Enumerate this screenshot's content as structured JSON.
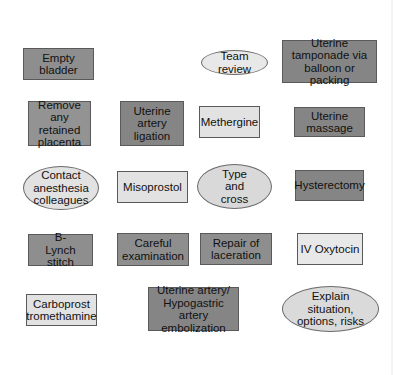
{
  "diagram": {
    "title": "",
    "colors": {
      "dark_fill": "#8e8e8e",
      "light_fill": "#e2e2e2",
      "border": "#5a5a5a"
    },
    "nodes": [
      {
        "id": "empty-bladder",
        "label": "Empty bladder",
        "shape": "rect",
        "fill": "dark"
      },
      {
        "id": "team-review",
        "label": "Team review",
        "shape": "ellipse",
        "fill": "light"
      },
      {
        "id": "uterine-tamponade",
        "label": "Uterine tamponade via balloon or packing",
        "shape": "rect",
        "fill": "dark"
      },
      {
        "id": "remove-placenta",
        "label": "Remove any retained placenta",
        "shape": "rect",
        "fill": "dark"
      },
      {
        "id": "uterine-artery-ligation",
        "label": "Uterine artery ligation",
        "shape": "rect",
        "fill": "dark"
      },
      {
        "id": "methergine",
        "label": "Methergine",
        "shape": "rect",
        "fill": "light"
      },
      {
        "id": "uterine-massage",
        "label": "Uterine massage",
        "shape": "rect",
        "fill": "dark"
      },
      {
        "id": "contact-anesthesia",
        "label": "Contact anesthesia colleagues",
        "shape": "ellipse",
        "fill": "light"
      },
      {
        "id": "misoprostol",
        "label": "Misoprostol",
        "shape": "rect",
        "fill": "light"
      },
      {
        "id": "type-and-cross",
        "label": "Type and cross",
        "shape": "ellipse",
        "fill": "light"
      },
      {
        "id": "hysterectomy",
        "label": "Hysterectomy",
        "shape": "rect",
        "fill": "dark"
      },
      {
        "id": "b-lynch-stitch",
        "label": "B-Lynch stitch",
        "shape": "rect",
        "fill": "dark"
      },
      {
        "id": "careful-examination",
        "label": "Careful examination",
        "shape": "rect",
        "fill": "dark"
      },
      {
        "id": "repair-laceration",
        "label": "Repair of laceration",
        "shape": "rect",
        "fill": "dark"
      },
      {
        "id": "iv-oxytocin",
        "label": "IV Oxytocin",
        "shape": "rect",
        "fill": "light"
      },
      {
        "id": "carboprost",
        "label": "Carboprost tromethamine",
        "shape": "rect",
        "fill": "light"
      },
      {
        "id": "embolization",
        "label": "Uterine artery/ Hypogastric artery embolization",
        "shape": "rect",
        "fill": "dark"
      },
      {
        "id": "explain-situation",
        "label": "Explain situation, options, risks",
        "shape": "ellipse",
        "fill": "light"
      }
    ]
  }
}
